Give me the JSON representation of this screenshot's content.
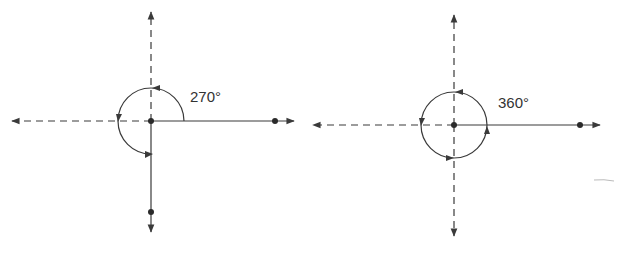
{
  "diagrams": [
    {
      "name": "rotation-270",
      "label": "270°",
      "angle": 270
    },
    {
      "name": "rotation-360",
      "label": "360°",
      "angle": 360
    }
  ],
  "colors": {
    "line": "#3a3a3a",
    "background": "#ffffff"
  }
}
